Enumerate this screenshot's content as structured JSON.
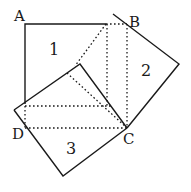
{
  "diagram": {
    "type": "geometric-proof",
    "vertex_labels": {
      "A": "A",
      "B": "B",
      "C": "C",
      "D": "D"
    },
    "region_labels": {
      "square1": "1",
      "square2": "2",
      "square3": "3"
    },
    "colors": {
      "stroke": "#1a1a1a",
      "background": "#ffffff"
    }
  }
}
